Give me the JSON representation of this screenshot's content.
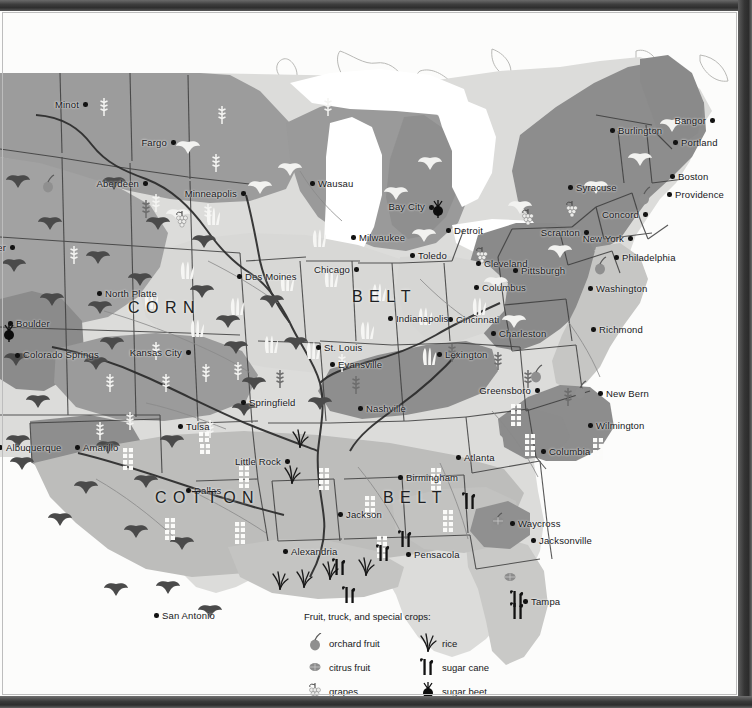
{
  "map": {
    "title": "Agricultural regions of the eastern United States",
    "belt_labels": [
      {
        "text": "C O R N",
        "x": 128,
        "y": 288
      },
      {
        "text": "B E L T",
        "x": 352,
        "y": 277
      },
      {
        "text": "C O T T O N",
        "x": 155,
        "y": 478
      },
      {
        "text": "B E L T",
        "x": 383,
        "y": 478
      }
    ],
    "cities": [
      {
        "name": "Minot",
        "x": 85,
        "y": 93,
        "side": "l"
      },
      {
        "name": "Fargo",
        "x": 173,
        "y": 131,
        "side": "l"
      },
      {
        "name": "Aberdeen",
        "x": 145,
        "y": 172,
        "side": "l"
      },
      {
        "name": "Minneapolis",
        "x": 243,
        "y": 182,
        "side": "l"
      },
      {
        "name": "Wausau",
        "x": 312,
        "y": 172,
        "side": "r"
      },
      {
        "name": "Bay City",
        "x": 431,
        "y": 196,
        "side": "l",
        "two": true
      },
      {
        "name": "Detroit",
        "x": 448,
        "y": 219,
        "side": "r"
      },
      {
        "name": "Milwaukee",
        "x": 353,
        "y": 226,
        "side": "r"
      },
      {
        "name": "Burlington",
        "x": 612,
        "y": 119,
        "side": "r"
      },
      {
        "name": "Bangor",
        "x": 712,
        "y": 109,
        "side": "l"
      },
      {
        "name": "Portland",
        "x": 675,
        "y": 131,
        "side": "r"
      },
      {
        "name": "Boston",
        "x": 672,
        "y": 165,
        "side": "r"
      },
      {
        "name": "Providence",
        "x": 669,
        "y": 183,
        "side": "r"
      },
      {
        "name": "Syracuse",
        "x": 570,
        "y": 176,
        "side": "r"
      },
      {
        "name": "Concord",
        "x": 645,
        "y": 203,
        "side": "l"
      },
      {
        "name": "New York",
        "x": 630,
        "y": 227,
        "side": "l"
      },
      {
        "name": "Philadelphia",
        "x": 616,
        "y": 246,
        "side": "r"
      },
      {
        "name": "Scranton",
        "x": 586,
        "y": 221,
        "side": "l"
      },
      {
        "name": "Pittsburgh",
        "x": 515,
        "y": 259,
        "side": "r"
      },
      {
        "name": "Cleveland",
        "x": 478,
        "y": 252,
        "side": "r"
      },
      {
        "name": "Toledo",
        "x": 412,
        "y": 244,
        "side": "r"
      },
      {
        "name": "Chicago",
        "x": 356,
        "y": 258,
        "side": "l"
      },
      {
        "name": "Des Moines",
        "x": 239,
        "y": 265,
        "side": "r"
      },
      {
        "name": "North Platte",
        "x": 99,
        "y": 282,
        "side": "r"
      },
      {
        "name": "Columbus",
        "x": 476,
        "y": 276,
        "side": "r"
      },
      {
        "name": "Washington",
        "x": 590,
        "y": 277,
        "side": "r"
      },
      {
        "name": "Cincinnati",
        "x": 450,
        "y": 308,
        "side": "r"
      },
      {
        "name": "Indianapolis",
        "x": 390,
        "y": 307,
        "side": "r"
      },
      {
        "name": "Richmond",
        "x": 593,
        "y": 318,
        "side": "r"
      },
      {
        "name": "Charleston",
        "x": 493,
        "y": 322,
        "side": "r"
      },
      {
        "name": "Boulder",
        "x": 10,
        "y": 312,
        "side": "r"
      },
      {
        "name": "Colorado Springs",
        "x": 17,
        "y": 344,
        "side": "r",
        "two": true
      },
      {
        "name": "St. Louis",
        "x": 318,
        "y": 336,
        "side": "r"
      },
      {
        "name": "Kansas City",
        "x": 188,
        "y": 341,
        "side": "l"
      },
      {
        "name": "Evansville",
        "x": 332,
        "y": 353,
        "side": "r"
      },
      {
        "name": "Lexington",
        "x": 439,
        "y": 343,
        "side": "r"
      },
      {
        "name": "Casper",
        "x": 12,
        "y": 236,
        "side": "l"
      },
      {
        "name": "Springfield",
        "x": 243,
        "y": 391,
        "side": "r"
      },
      {
        "name": "Nashville",
        "x": 360,
        "y": 397,
        "side": "r"
      },
      {
        "name": "Greensboro",
        "x": 537,
        "y": 379,
        "side": "l"
      },
      {
        "name": "New Bern",
        "x": 600,
        "y": 382,
        "side": "r"
      },
      {
        "name": "Tulsa",
        "x": 180,
        "y": 415,
        "side": "r"
      },
      {
        "name": "Wilmington",
        "x": 590,
        "y": 414,
        "side": "r"
      },
      {
        "name": "Amarillo",
        "x": 77,
        "y": 436,
        "side": "r"
      },
      {
        "name": "Albuquerque",
        "x": 0,
        "y": 436,
        "side": "r"
      },
      {
        "name": "Little Rock",
        "x": 287,
        "y": 450,
        "side": "l"
      },
      {
        "name": "Atlanta",
        "x": 458,
        "y": 446,
        "side": "r"
      },
      {
        "name": "Columbia",
        "x": 543,
        "y": 440,
        "side": "r"
      },
      {
        "name": "Birmingham",
        "x": 400,
        "y": 466,
        "side": "r"
      },
      {
        "name": "Jackson",
        "x": 340,
        "y": 503,
        "side": "r"
      },
      {
        "name": "Dallas",
        "x": 188,
        "y": 479,
        "side": "r"
      },
      {
        "name": "Waycross",
        "x": 512,
        "y": 512,
        "side": "r"
      },
      {
        "name": "Jacksonville",
        "x": 533,
        "y": 529,
        "side": "r"
      },
      {
        "name": "Alexandria",
        "x": 285,
        "y": 540,
        "side": "r"
      },
      {
        "name": "Pensacola",
        "x": 408,
        "y": 543,
        "side": "r"
      },
      {
        "name": "San Antonio",
        "x": 156,
        "y": 604,
        "side": "r"
      },
      {
        "name": "Tampa",
        "x": 525,
        "y": 590,
        "side": "r"
      }
    ]
  },
  "legend": {
    "title": "Fruit, truck, and special crops:",
    "entries": [
      {
        "icon": "orchard-fruit-icon",
        "label": "orchard fruit"
      },
      {
        "icon": "rice-icon",
        "label": "rice"
      },
      {
        "icon": "citrus-fruit-icon",
        "label": "citrus fruit"
      },
      {
        "icon": "sugar-cane-icon",
        "label": "sugar cane"
      },
      {
        "icon": "grapes-icon",
        "label": "grapes"
      },
      {
        "icon": "sugar-beet-icon",
        "label": "sugar beet"
      }
    ]
  },
  "colors": {
    "region_dark_gray": "#8e8e8e",
    "region_mid_gray": "#a9a9a9",
    "region_light_gray": "#c8c8c8",
    "region_pale": "#dcdcda",
    "water_white": "#ffffff",
    "border_frame": "#353535",
    "text": "#17181a"
  }
}
